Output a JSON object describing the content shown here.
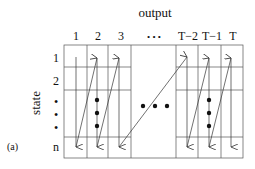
{
  "figure": {
    "panel_label": "(a)",
    "x_axis_title": "output",
    "y_axis_title": "state",
    "column_labels": [
      "1",
      "2",
      "3",
      "• • •",
      "T−2",
      "T−1",
      "T"
    ],
    "row_labels": [
      "1",
      "2",
      "•",
      "•",
      "•",
      "n"
    ],
    "middle_ellipsis": "• • •",
    "line_color": "#333333",
    "background": "#ffffff"
  }
}
